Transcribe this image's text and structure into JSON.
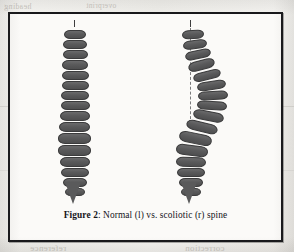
{
  "page": {
    "background_color": "#f2f1ee",
    "frame_color": "#17171a",
    "figure_background": "#fbfaf8"
  },
  "figure": {
    "caption_label": "Figure 2",
    "caption_separator": ": ",
    "caption_text": "Normal (l) vs. scoliotic (r) spine",
    "vertebra_color": "#5d5d5e",
    "plumbline_color": "#7b7b7c"
  },
  "spines": [
    {
      "id": "normal",
      "name": "Normal spine",
      "side_label": "l",
      "has_plumb_line": false,
      "tick": {
        "x": 52,
        "y": 6,
        "h": 7
      },
      "sacrum": {
        "x": 43,
        "y": 168
      },
      "vertebrae": [
        {
          "x": 42,
          "y": 16,
          "w": 22,
          "h": 9
        },
        {
          "x": 41,
          "y": 26,
          "w": 24,
          "h": 9
        },
        {
          "x": 41,
          "y": 36,
          "w": 25,
          "h": 9
        },
        {
          "x": 40,
          "y": 46,
          "w": 26,
          "h": 10
        },
        {
          "x": 40,
          "y": 57,
          "w": 27,
          "h": 9
        },
        {
          "x": 40,
          "y": 67,
          "w": 27,
          "h": 9
        },
        {
          "x": 39,
          "y": 77,
          "w": 28,
          "h": 9
        },
        {
          "x": 39,
          "y": 87,
          "w": 29,
          "h": 9
        },
        {
          "x": 38,
          "y": 97,
          "w": 30,
          "h": 10
        },
        {
          "x": 37,
          "y": 108,
          "w": 31,
          "h": 10
        },
        {
          "x": 36,
          "y": 119,
          "w": 33,
          "h": 11
        },
        {
          "x": 36,
          "y": 131,
          "w": 33,
          "h": 11
        },
        {
          "x": 38,
          "y": 143,
          "w": 30,
          "h": 10
        },
        {
          "x": 39,
          "y": 154,
          "w": 28,
          "h": 9
        },
        {
          "x": 41,
          "y": 164,
          "w": 24,
          "h": 9
        },
        {
          "x": 43,
          "y": 174,
          "w": 20,
          "h": 8
        }
      ]
    },
    {
      "id": "scoliotic",
      "name": "Scoliotic spine",
      "side_label": "r",
      "has_plumb_line": true,
      "tick": {
        "x": 42,
        "y": 6,
        "h": 7
      },
      "plumb": {
        "x": 42,
        "y": 14,
        "h": 96
      },
      "sacrum": {
        "x": 33,
        "y": 168
      },
      "vertebrae": [
        {
          "x": 34,
          "y": 16,
          "w": 22,
          "h": 9,
          "rot": -4
        },
        {
          "x": 35,
          "y": 26,
          "w": 24,
          "h": 9,
          "rot": -8
        },
        {
          "x": 37,
          "y": 36,
          "w": 26,
          "h": 9,
          "rot": -12
        },
        {
          "x": 40,
          "y": 46,
          "w": 27,
          "h": 10,
          "rot": -15
        },
        {
          "x": 45,
          "y": 57,
          "w": 28,
          "h": 9,
          "rot": -14
        },
        {
          "x": 49,
          "y": 67,
          "w": 29,
          "h": 9,
          "rot": -9
        },
        {
          "x": 50,
          "y": 77,
          "w": 30,
          "h": 9,
          "rot": -3
        },
        {
          "x": 49,
          "y": 87,
          "w": 30,
          "h": 9,
          "rot": 4
        },
        {
          "x": 45,
          "y": 97,
          "w": 31,
          "h": 10,
          "rot": 11
        },
        {
          "x": 38,
          "y": 108,
          "w": 32,
          "h": 10,
          "rot": 14
        },
        {
          "x": 31,
          "y": 119,
          "w": 33,
          "h": 11,
          "rot": 12
        },
        {
          "x": 28,
          "y": 131,
          "w": 32,
          "h": 11,
          "rot": 7
        },
        {
          "x": 28,
          "y": 143,
          "w": 30,
          "h": 10,
          "rot": 2
        },
        {
          "x": 29,
          "y": 154,
          "w": 28,
          "h": 9,
          "rot": 0
        },
        {
          "x": 31,
          "y": 164,
          "w": 24,
          "h": 9,
          "rot": 0
        },
        {
          "x": 33,
          "y": 174,
          "w": 20,
          "h": 8,
          "rot": 0
        }
      ]
    }
  ],
  "bleed_text": {
    "line1": "overprint",
    "line2": "purpose",
    "line3": "Figure 1",
    "line4": "spinal curvature",
    "line5": "analysis of the",
    "line6": "shown in the",
    "line7": "measured from",
    "line8": "the region of",
    "line9": "reference",
    "line10": "correction",
    "line11": "heading"
  }
}
